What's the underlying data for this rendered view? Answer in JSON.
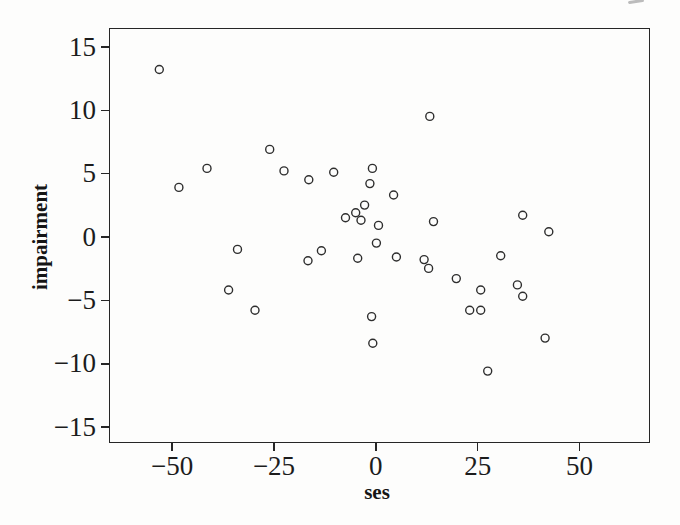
{
  "page": {
    "background": "#fdfdfc",
    "ink": "#262626",
    "kind": "scanned statistics textbook scatterplot"
  },
  "chart_data": {
    "type": "scatter",
    "title": "",
    "xlabel": "ses",
    "ylabel": "impairment",
    "x_ticks": [
      -50,
      -25,
      0,
      25,
      50
    ],
    "y_ticks": [
      15,
      10,
      5,
      0,
      -5,
      -10,
      -15
    ],
    "xlim": [
      -65.5,
      66.8
    ],
    "ylim": [
      -16.1,
      16.5
    ],
    "grid": false,
    "legend": null,
    "marker": {
      "shape": "open-circle",
      "radius_px": 4,
      "stroke": "#2e2e2e",
      "stroke_width": 1.4
    },
    "points": [
      [
        -53.4,
        13.3
      ],
      [
        -48.6,
        4.0
      ],
      [
        -41.7,
        5.5
      ],
      [
        -26.3,
        7.0
      ],
      [
        -22.8,
        5.3
      ],
      [
        -16.7,
        4.6
      ],
      [
        -10.6,
        5.2
      ],
      [
        -1.1,
        5.5
      ],
      [
        -1.7,
        4.3
      ],
      [
        4.1,
        3.4
      ],
      [
        -3.0,
        2.6
      ],
      [
        -5.2,
        2.0
      ],
      [
        -7.7,
        1.6
      ],
      [
        -3.9,
        1.4
      ],
      [
        0.4,
        1.0
      ],
      [
        13.9,
        1.3
      ],
      [
        13.0,
        9.6
      ],
      [
        35.8,
        1.8
      ],
      [
        42.2,
        0.5
      ],
      [
        -34.2,
        -0.9
      ],
      [
        -36.4,
        -4.1
      ],
      [
        -29.9,
        -5.7
      ],
      [
        -16.9,
        -1.8
      ],
      [
        -13.6,
        -1.0
      ],
      [
        -4.7,
        -1.6
      ],
      [
        -0.1,
        -0.4
      ],
      [
        4.8,
        -1.5
      ],
      [
        11.6,
        -1.7
      ],
      [
        12.7,
        -2.4
      ],
      [
        19.5,
        -3.2
      ],
      [
        -1.3,
        -6.2
      ],
      [
        -1.0,
        -8.3
      ],
      [
        30.4,
        -1.4
      ],
      [
        25.5,
        -4.1
      ],
      [
        34.5,
        -3.7
      ],
      [
        35.8,
        -4.6
      ],
      [
        22.8,
        -5.7
      ],
      [
        25.5,
        -5.7
      ],
      [
        41.3,
        -7.9
      ],
      [
        27.2,
        -10.5
      ]
    ]
  }
}
